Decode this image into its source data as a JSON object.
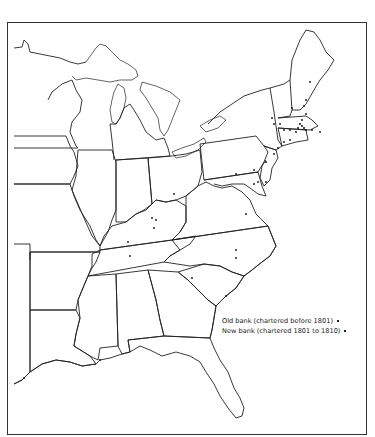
{
  "legend": {
    "items": [
      {
        "label": "Old bank (chartered before 1801)",
        "marker": "dot-small"
      },
      {
        "label": "New bank (chartered 1801 to 1810)",
        "marker": "dot"
      }
    ]
  },
  "map": {
    "region": "Eastern United States",
    "marker_color": "#111111",
    "line_color": "#222222"
  }
}
